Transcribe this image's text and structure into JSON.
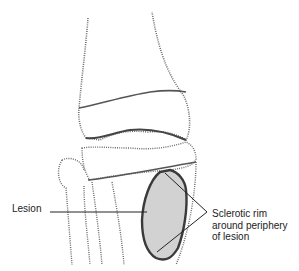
{
  "diagram": {
    "colors": {
      "bone_stipple": "#555555",
      "lesion_fill": "#d2d2d2",
      "rim_stroke": "#3a3a3a",
      "leader_line": "#222222",
      "background": "#ffffff"
    },
    "labels": {
      "lesion": "Lesion",
      "rim_line1": "Sclerotic rim",
      "rim_line2": "around periphery",
      "rim_line3": "of lesion"
    }
  }
}
